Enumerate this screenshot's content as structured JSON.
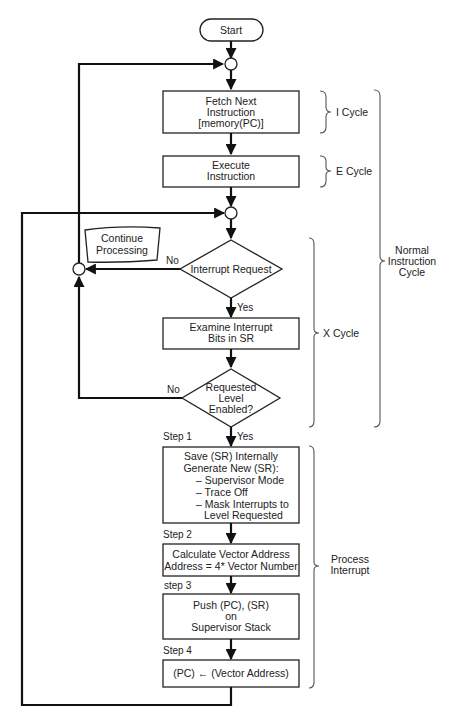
{
  "diagram": {
    "type": "flowchart",
    "start": "Start",
    "nodes": {
      "fetch": [
        "Fetch Next",
        "Instruction",
        "[memory(PC)]"
      ],
      "execute": [
        "Execute",
        "Instruction"
      ],
      "continue": [
        "Continue",
        "Processing"
      ],
      "interrupt_request": "Interrupt Request",
      "examine": [
        "Examine Interrupt",
        "Bits in SR"
      ],
      "level_enabled": [
        "Requested",
        "Level",
        "Enabled?"
      ],
      "step1": [
        "Save (SR) Internally",
        "Generate New (SR):",
        "– Supervisor Mode",
        "– Trace Off",
        "– Mask Interrupts to",
        "Level Requested"
      ],
      "step2": [
        "Calculate Vector Address",
        "Address = 4* Vector Number"
      ],
      "step3": [
        "Push (PC), (SR)",
        "on",
        "Supervisor Stack"
      ],
      "step4": "(PC) ← (Vector Address)"
    },
    "edge_labels": {
      "no1": "No",
      "yes1": "Yes",
      "no2": "No",
      "yes2": "Yes"
    },
    "step_labels": [
      "Step 1",
      "Step 2",
      "step 3",
      "Step 4"
    ],
    "braces": {
      "i_cycle": "I Cycle",
      "e_cycle": "E Cycle",
      "x_cycle": "X Cycle",
      "normal": [
        "Normal",
        "Instruction",
        "Cycle"
      ],
      "process": [
        "Process",
        "Interrupt"
      ]
    }
  }
}
